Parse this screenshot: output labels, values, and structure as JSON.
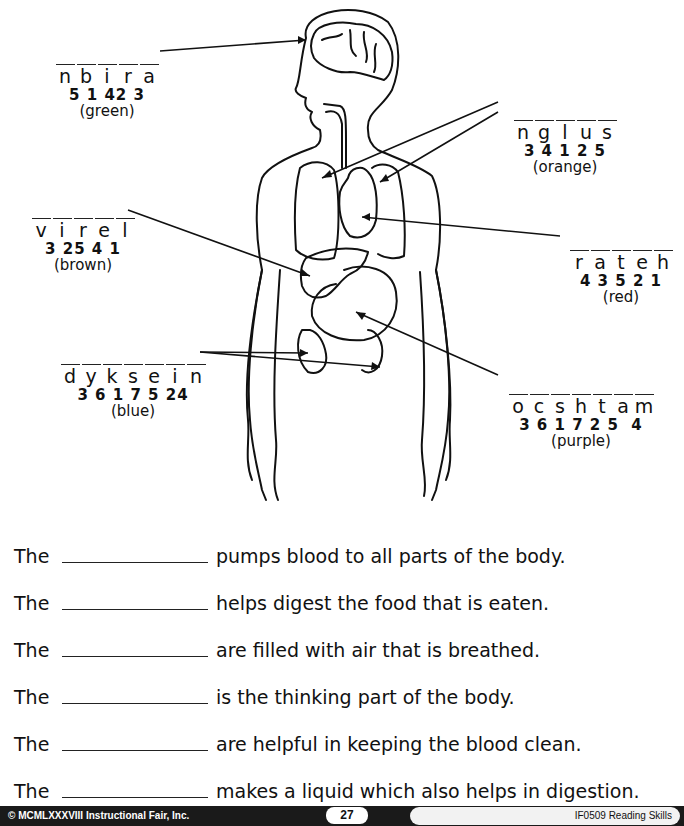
{
  "labels": {
    "brain": {
      "scrambled": [
        "n",
        "b",
        "i",
        "r",
        "a"
      ],
      "numbers": "5 1 42 3",
      "color": "(green)"
    },
    "lungs": {
      "scrambled": [
        "n",
        "g",
        "l",
        "u",
        "s"
      ],
      "numbers": "3 4 1 2 5",
      "color": "(orange)"
    },
    "liver": {
      "scrambled": [
        "v",
        "i",
        "r",
        "e",
        "l"
      ],
      "numbers": "3 25 4 1",
      "color": "(brown)"
    },
    "heart": {
      "scrambled": [
        "r",
        "a",
        "t",
        "e",
        "h"
      ],
      "numbers": "4 3 5 2 1",
      "color": "(red)"
    },
    "kidneys": {
      "scrambled": [
        "d",
        "y",
        "k",
        "s",
        "e",
        "i",
        "n"
      ],
      "numbers": "3 6 1 7 5 24",
      "color": "(blue)"
    },
    "stomach": {
      "scrambled": [
        "o",
        "c",
        "s",
        "h",
        "t",
        "a",
        "m"
      ],
      "numbers": "3 6 1 7 2 5  4",
      "color": "(purple)"
    }
  },
  "sentences": [
    {
      "prefix": "The",
      "text": "pumps blood to all parts of the body."
    },
    {
      "prefix": "The",
      "text": "helps digest the food that is eaten."
    },
    {
      "prefix": "The",
      "text": "are filled with air that is breathed."
    },
    {
      "prefix": "The",
      "text": "is the thinking part of the body."
    },
    {
      "prefix": "The",
      "text": "are helpful in keeping the blood clean."
    },
    {
      "prefix": "The",
      "text": "makes a liquid which also helps in digestion."
    }
  ],
  "footer": {
    "copyright": "© MCMLXXXVIII Instructional Fair, Inc.",
    "page_number": "27",
    "book": "IF0509 Reading Skills"
  }
}
